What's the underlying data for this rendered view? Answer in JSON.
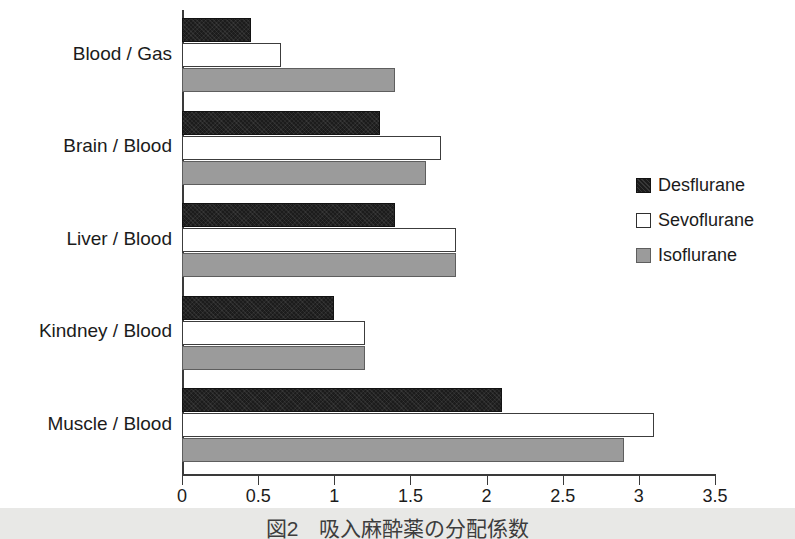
{
  "figure": {
    "caption": "図2　吸入麻酔薬の分配係数"
  },
  "chart_data": {
    "type": "bar",
    "orientation": "horizontal",
    "title": "",
    "xlabel": "",
    "ylabel": "",
    "xlim": [
      0,
      3.5
    ],
    "xticks": [
      "0",
      "0.5",
      "1",
      "1.5",
      "2",
      "2.5",
      "3",
      "3.5"
    ],
    "xtick_values": [
      0,
      0.5,
      1,
      1.5,
      2,
      2.5,
      3,
      3.5
    ],
    "grid": false,
    "legend_position": "right",
    "categories": [
      "Blood / Gas",
      "Brain / Blood",
      "Liver / Blood",
      "Kindney / Blood",
      "Muscle / Blood"
    ],
    "series": [
      {
        "name": "Desflurane",
        "color": "#1c1c1c",
        "values": [
          0.45,
          1.3,
          1.4,
          1.0,
          2.1
        ]
      },
      {
        "name": "Sevoflurane",
        "color": "#ffffff",
        "values": [
          0.65,
          1.7,
          1.8,
          1.2,
          3.1
        ]
      },
      {
        "name": "Isoflurane",
        "color": "#9b9b9b",
        "values": [
          1.4,
          1.6,
          1.8,
          1.2,
          2.9
        ]
      }
    ]
  }
}
